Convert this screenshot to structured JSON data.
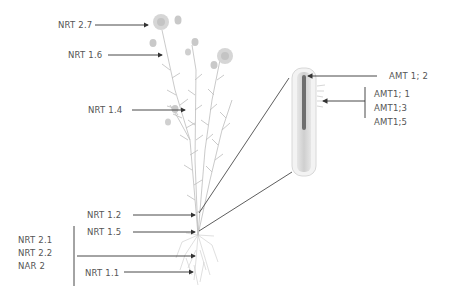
{
  "diagram": {
    "title": "",
    "colors": {
      "arrow": "#333333",
      "text": "#555555",
      "plant": "#b5b5b5",
      "flower": "#cfcfcf",
      "root_outer": "#e9e9e9",
      "root_inner": "#8a8a8a"
    },
    "plant_labels": {
      "nrt27": "NRT 2.7",
      "nrt16": "NRT 1.6",
      "nrt14": "NRT 1.4",
      "nrt12": "NRT 1.2",
      "nrt15": "NRT 1.5",
      "nrt21": "NRT 2.1",
      "nrt22": "NRT 2.2",
      "nar2": "NAR 2",
      "nrt11": "NRT 1.1"
    },
    "root_inset_labels": {
      "amt12": "AMT 1; 2",
      "amt11": "AMT1; 1",
      "amt13": "AMT1;3",
      "amt15": "AMT1;5"
    }
  }
}
